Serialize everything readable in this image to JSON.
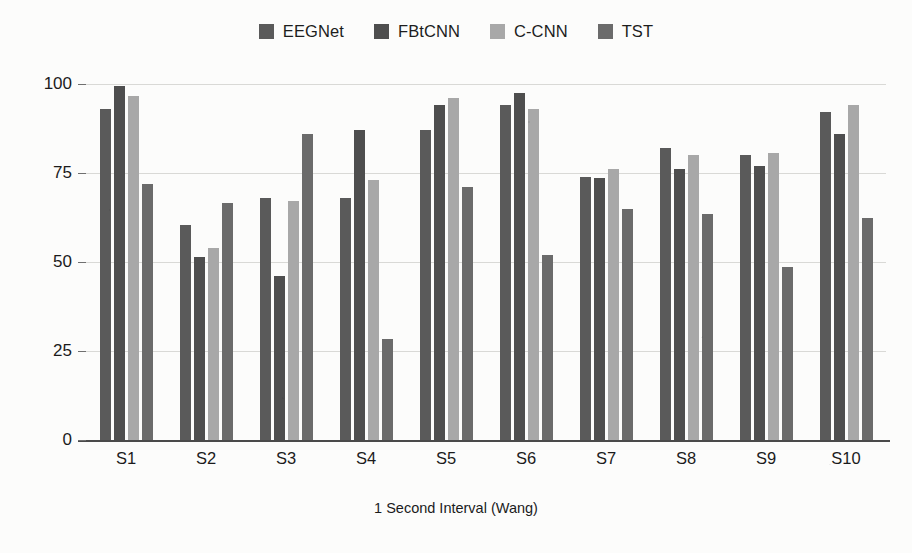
{
  "chart_data": {
    "type": "bar",
    "title": "",
    "xlabel": "1 Second Interval (Wang)",
    "ylabel": "",
    "categories": [
      "S1",
      "S2",
      "S3",
      "S4",
      "S5",
      "S6",
      "S7",
      "S8",
      "S9",
      "S10"
    ],
    "ylim": [
      0,
      100
    ],
    "yticks": [
      0,
      25,
      50,
      75,
      100
    ],
    "ytick_labels": [
      "0",
      "25",
      "50",
      "75",
      "100"
    ],
    "grid": "horizontal",
    "legend_position": "top-center",
    "series": [
      {
        "name": "EEGNet",
        "color": "#5a5a5a",
        "values": [
          93,
          60.5,
          68,
          68,
          87,
          94,
          74,
          82,
          80,
          92
        ]
      },
      {
        "name": "FBtCNN",
        "color": "#4e4e4e",
        "values": [
          99.5,
          51.5,
          46,
          87,
          94,
          97.5,
          73.5,
          76,
          77,
          86
        ]
      },
      {
        "name": "C-CNN",
        "color": "#a8a8a8",
        "values": [
          96.5,
          54,
          67,
          73,
          96,
          93,
          76,
          80,
          80.5,
          94
        ]
      },
      {
        "name": "TST",
        "color": "#6b6b6b",
        "values": [
          72,
          66.5,
          86,
          28.5,
          71,
          52,
          65,
          63.5,
          48.5,
          62.5
        ]
      }
    ]
  },
  "axis": {
    "baseline_color": "#4a4a4a",
    "gridline_color": "#d9d9d6"
  }
}
